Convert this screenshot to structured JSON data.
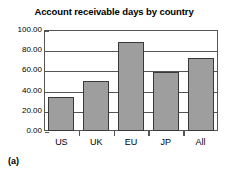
{
  "caption": "(a)",
  "chart_data": {
    "type": "bar",
    "title": "Account receivable days by country",
    "xlabel": "",
    "ylabel": "",
    "categories": [
      "US",
      "UK",
      "EU",
      "JP",
      "All"
    ],
    "values": [
      34,
      50,
      88,
      58,
      72
    ],
    "ylim": [
      0,
      100
    ],
    "ytick_values": [
      0,
      20,
      40,
      60,
      80,
      100
    ],
    "ytick_labels": [
      "0.00",
      "20.00",
      "40.00",
      "60.00",
      "80.00",
      "100.00"
    ],
    "grid": true,
    "legend": null,
    "bar_fill_color": "#9e9e9e",
    "bar_border_color": "#3a3a3a",
    "axis_color": "#555555",
    "background_color": "#ffffff"
  }
}
